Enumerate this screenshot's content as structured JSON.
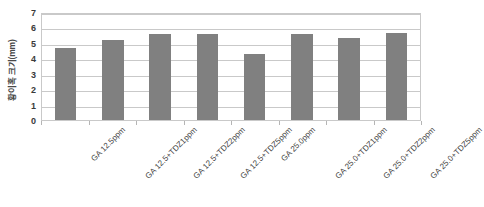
{
  "chart_data": {
    "type": "bar",
    "title": "",
    "subtitle": "",
    "xlabel": "",
    "ylabel": "황이혹 크기(mm)",
    "categories": [
      "GA 12.5ppm",
      "GA 12.5+TDZ1ppm",
      "GA 12.5+TDZ2ppm",
      "GA 12.5+TDZ5ppm",
      "GA 25.0ppm",
      "GA 25.0+TDZ1ppm",
      "GA 25.0+TDZ2ppm",
      "GA 25.0+TDZ5ppm"
    ],
    "values": [
      4.7,
      5.2,
      5.6,
      5.55,
      4.3,
      5.6,
      5.3,
      5.65
    ],
    "ylim": [
      0,
      7
    ],
    "ytick_labels": [
      "7",
      "6",
      "5",
      "4",
      "3",
      "2",
      "1",
      "0"
    ],
    "ytick_values": [
      7,
      6,
      5,
      4,
      3,
      2,
      1,
      0
    ],
    "grid": true,
    "legend": false,
    "legend_position": "none",
    "series_color": "#808080",
    "gridline_color": "#c9c9c9",
    "plot_border_color": "#c9c9c9",
    "background_color": "#ffffff",
    "xtick_label_rotation": -45
  }
}
